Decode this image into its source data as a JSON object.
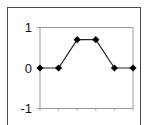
{
  "chart_data": {
    "type": "line",
    "title": "",
    "xlabel": "",
    "ylabel": "",
    "x": [
      1,
      2,
      3,
      4,
      5,
      6
    ],
    "series": [
      {
        "name": "series-1",
        "values": [
          0,
          0,
          0.7,
          0.7,
          0,
          0
        ],
        "color": "#222222",
        "marker": "diamond"
      }
    ],
    "ylim": [
      -1,
      1
    ],
    "yticks": [
      1,
      0,
      -1
    ],
    "ytick_labels": [
      "1",
      "0",
      "-1"
    ],
    "xticks_labeled": false,
    "grid": false,
    "legend": "none",
    "axis_color": "#9a9a9a",
    "frame_color": "#4a4a4a"
  }
}
